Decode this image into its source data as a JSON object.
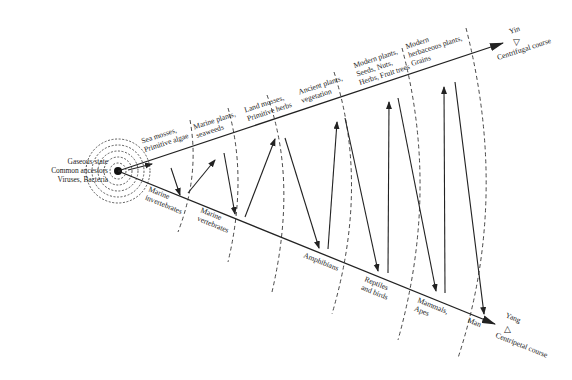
{
  "diagram": {
    "origin": {
      "label_lines": [
        "Gaseous state",
        "Common ancestors",
        "Viruses, Bacteria"
      ]
    },
    "upper_course": {
      "name": "Centrifugal course",
      "pole": "Yin",
      "pole_symbol": "▽",
      "stages": [
        {
          "lines": [
            "Sea mosses,",
            "Primitive algae"
          ]
        },
        {
          "lines": [
            "Marine plants,",
            "seaweeds"
          ]
        },
        {
          "lines": [
            "Land mosses,",
            "Primitive herbs"
          ]
        },
        {
          "lines": [
            "Ancient plants,",
            "vegetation"
          ]
        },
        {
          "lines": [
            "Modern plants,",
            "Seeds, Nuts,",
            "Herbs, Fruit trees"
          ]
        },
        {
          "lines": [
            "Modern",
            "herbaceous plants,",
            "Grains"
          ]
        }
      ]
    },
    "lower_course": {
      "name": "Centripetal course",
      "pole": "Yang",
      "pole_symbol": "△",
      "stages": [
        {
          "lines": [
            "Marine",
            "invertebrates"
          ]
        },
        {
          "lines": [
            "Marine",
            "vertebrates"
          ]
        },
        {
          "lines": [
            "Amphibians"
          ]
        },
        {
          "lines": [
            "Reptiles",
            "and birds"
          ]
        },
        {
          "lines": [
            "Mammals,",
            "Apes"
          ]
        },
        {
          "lines": [
            "Man"
          ]
        }
      ]
    },
    "colors": {
      "ink": "#222222",
      "background": "#ffffff"
    }
  }
}
